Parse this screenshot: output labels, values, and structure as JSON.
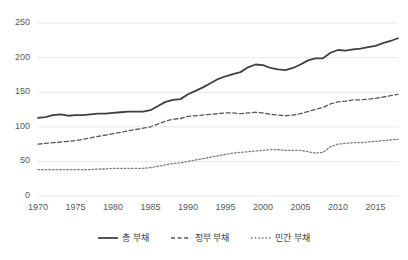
{
  "chart_data": {
    "type": "line",
    "title": "",
    "xlabel": "",
    "ylabel": "",
    "xlim": [
      1970,
      2018
    ],
    "ylim": [
      0,
      250
    ],
    "yticks": [
      0,
      50,
      100,
      150,
      200,
      250
    ],
    "xticks": [
      1970,
      1975,
      1980,
      1985,
      1990,
      1995,
      2000,
      2005,
      2010,
      2015
    ],
    "grid": "horizontal",
    "legend_position": "bottom",
    "x": [
      1970,
      1971,
      1972,
      1973,
      1974,
      1975,
      1976,
      1977,
      1978,
      1979,
      1980,
      1981,
      1982,
      1983,
      1984,
      1985,
      1986,
      1987,
      1988,
      1989,
      1990,
      1991,
      1992,
      1993,
      1994,
      1995,
      1996,
      1997,
      1998,
      1999,
      2000,
      2001,
      2002,
      2003,
      2004,
      2005,
      2006,
      2007,
      2008,
      2009,
      2010,
      2011,
      2012,
      2013,
      2014,
      2015,
      2016,
      2017,
      2018
    ],
    "series": [
      {
        "name": "총 부채",
        "style": "solid",
        "color": "#404040",
        "values": [
          113,
          114,
          117,
          118,
          116,
          117,
          117,
          118,
          119,
          119,
          120,
          121,
          122,
          122,
          122,
          124,
          130,
          136,
          139,
          140,
          147,
          152,
          157,
          163,
          169,
          173,
          176,
          179,
          186,
          190,
          189,
          185,
          183,
          182,
          185,
          190,
          196,
          199,
          199,
          207,
          211,
          210,
          212,
          213,
          215,
          217,
          221,
          224,
          228
        ]
      },
      {
        "name": "정부 부채",
        "style": "dotted",
        "color": "#595959",
        "values": [
          75,
          76,
          77,
          78,
          79,
          80,
          82,
          84,
          86,
          88,
          90,
          92,
          94,
          96,
          98,
          100,
          104,
          108,
          111,
          112,
          115,
          116,
          117,
          118,
          119,
          120,
          120,
          119,
          120,
          121,
          120,
          118,
          117,
          116,
          117,
          119,
          122,
          125,
          128,
          133,
          136,
          137,
          139,
          139,
          140,
          141,
          143,
          145,
          147
        ]
      },
      {
        "name": "민간 부채",
        "style": "dashed",
        "color": "#7f7f7f",
        "values": [
          38,
          38,
          38,
          38,
          38,
          38,
          38,
          38,
          39,
          39,
          40,
          40,
          40,
          40,
          40,
          41,
          43,
          45,
          47,
          48,
          50,
          52,
          54,
          56,
          58,
          60,
          62,
          63,
          64,
          65,
          66,
          67,
          67,
          66,
          66,
          66,
          64,
          62,
          63,
          71,
          75,
          76,
          77,
          77,
          78,
          79,
          80,
          81,
          82
        ]
      }
    ]
  },
  "legend": {
    "items": [
      {
        "label": "총 부채",
        "style": "solid"
      },
      {
        "label": "정부 부채",
        "style": "dotted"
      },
      {
        "label": "민간 부채",
        "style": "dashed"
      }
    ]
  }
}
